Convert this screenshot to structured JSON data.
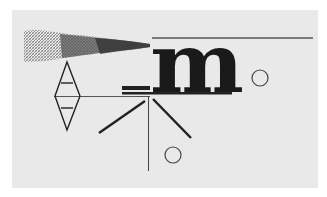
{
  "artwork": {
    "letter": "m",
    "colors": {
      "background": "#ffffff",
      "panel": "#e9e9e9",
      "ink": "#1a1a1a",
      "line": "#555555",
      "smoke_dark": "#444444",
      "smoke_light": "#9a9a9a"
    },
    "shapes": {
      "circles": [
        {
          "cx": 260,
          "cy": 78,
          "r": 8
        },
        {
          "cx": 173,
          "cy": 155,
          "r": 8
        }
      ]
    }
  }
}
